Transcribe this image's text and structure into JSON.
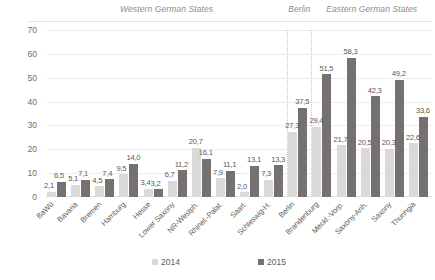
{
  "chart_data": {
    "type": "bar",
    "title": "",
    "xlabel": "",
    "ylabel": "",
    "ylim": [
      0,
      70
    ],
    "yticks": [
      0,
      10,
      20,
      30,
      40,
      50,
      60,
      70
    ],
    "grid": true,
    "legend_position": "bottom",
    "categories": [
      "BaWü",
      "Bavaria",
      "Bremen",
      "Hamburg",
      "Hesse",
      "Lower Saxony",
      "NR-Westph.",
      "Rhinel.-Palat.",
      "Saarl.",
      "Schleswig-H.",
      "Berlin",
      "Brandenburg",
      "Meckl.-Vorp.",
      "Saxony-Anh.",
      "Saxony",
      "Thuringia"
    ],
    "series": [
      {
        "name": "2014",
        "color": "#d9d9d9",
        "values": [
          2.1,
          5.1,
          4.5,
          9.5,
          3.4,
          6.7,
          20.7,
          7.9,
          2.0,
          7.3,
          27.3,
          29.4,
          21.7,
          20.5,
          20.3,
          22.6
        ],
        "labels": [
          "2,1",
          "5,1",
          "4,5",
          "9,5",
          "3,4",
          "6,7",
          "20,7",
          "7,9",
          "2,0",
          "7,3",
          "27,3",
          "29,4",
          "21,7",
          "20,5",
          "20,3",
          "22,6"
        ]
      },
      {
        "name": "2015",
        "color": "#767171",
        "values": [
          6.5,
          7.1,
          7.4,
          14.0,
          3.2,
          11.2,
          16.1,
          11.1,
          13.1,
          13.3,
          37.5,
          51.5,
          58.3,
          42.3,
          49.2,
          33.6
        ],
        "labels": [
          "6,5",
          "7,1",
          "7,4",
          "14,0",
          "3,2",
          "11,2",
          "16,1",
          "11,1",
          "13,1",
          "13,3",
          "37,5",
          "51,5",
          "58,3",
          "42,3",
          "49,2",
          "33,6"
        ]
      }
    ],
    "groups": [
      {
        "label": "Western German States",
        "start": 0,
        "end": 9
      },
      {
        "label": "Berlin",
        "start": 10,
        "end": 10
      },
      {
        "label": "Eastern German States",
        "start": 11,
        "end": 15
      }
    ],
    "ytick_labels": [
      "0",
      "10",
      "20",
      "30",
      "40",
      "50",
      "60",
      "70"
    ]
  }
}
